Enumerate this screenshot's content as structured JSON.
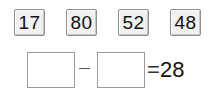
{
  "cards": [
    {
      "value": "17"
    },
    {
      "value": "80"
    },
    {
      "value": "52"
    },
    {
      "value": "48"
    }
  ],
  "equation": {
    "operand1": "",
    "operator": "−",
    "operand2": "",
    "equals": "=",
    "result": "28"
  }
}
